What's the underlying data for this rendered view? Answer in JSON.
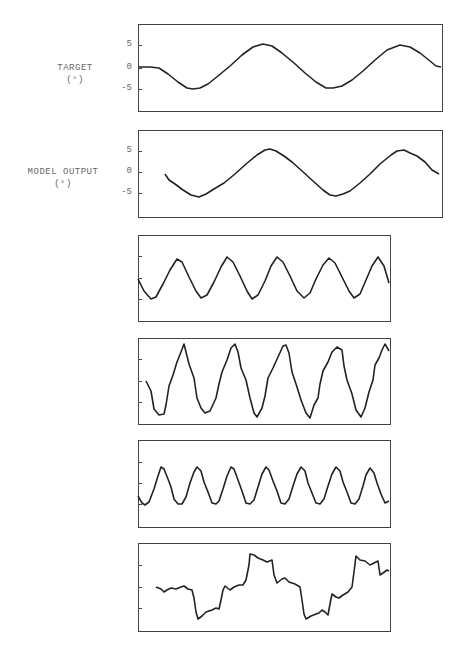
{
  "chart_data": [
    {
      "type": "line",
      "title": "",
      "ylabel": "TARGET (°)",
      "ylabel_lines": [
        "TARGET",
        "(°)"
      ],
      "yticks": [
        "5",
        "0",
        "-5"
      ],
      "ylim": [
        -9,
        9
      ],
      "grid": false,
      "frame_px": {
        "x": 138,
        "y": 24,
        "w": 304,
        "h": 87
      },
      "tick_px": [
        45,
        68,
        89
      ],
      "points_px": [
        [
          139,
          67
        ],
        [
          150,
          67
        ],
        [
          159,
          68
        ],
        [
          168,
          74
        ],
        [
          178,
          82
        ],
        [
          187,
          88
        ],
        [
          193,
          89
        ],
        [
          200,
          88
        ],
        [
          208,
          84
        ],
        [
          218,
          76
        ],
        [
          230,
          66
        ],
        [
          242,
          55
        ],
        [
          253,
          47
        ],
        [
          263,
          44
        ],
        [
          272,
          46
        ],
        [
          282,
          53
        ],
        [
          294,
          63
        ],
        [
          305,
          73
        ],
        [
          316,
          82
        ],
        [
          326,
          88
        ],
        [
          333,
          88
        ],
        [
          342,
          86
        ],
        [
          352,
          80
        ],
        [
          363,
          71
        ],
        [
          375,
          60
        ],
        [
          387,
          50
        ],
        [
          400,
          45
        ],
        [
          410,
          47
        ],
        [
          420,
          53
        ],
        [
          430,
          61
        ],
        [
          436,
          66
        ],
        [
          441,
          67
        ]
      ],
      "description": "Target angle: flat at 0°, then sinusoid ~±5° with two full cycles"
    },
    {
      "type": "line",
      "title": "",
      "ylabel": "MODEL OUTPUT (°)",
      "ylabel_lines": [
        "MODEL OUTPUT",
        "(°)"
      ],
      "yticks": [
        "5",
        "0",
        "-5"
      ],
      "ylim": [
        -9,
        9
      ],
      "grid": false,
      "frame_px": {
        "x": 138,
        "y": 130,
        "w": 304,
        "h": 87
      },
      "tick_px": [
        151,
        172,
        193
      ],
      "points_px": [
        [
          165,
          174
        ],
        [
          169,
          180
        ],
        [
          175,
          184
        ],
        [
          183,
          190
        ],
        [
          191,
          195
        ],
        [
          199,
          197
        ],
        [
          206,
          194
        ],
        [
          214,
          189
        ],
        [
          224,
          183
        ],
        [
          235,
          174
        ],
        [
          246,
          164
        ],
        [
          257,
          155
        ],
        [
          265,
          150
        ],
        [
          270,
          149
        ],
        [
          276,
          151
        ],
        [
          284,
          156
        ],
        [
          292,
          162
        ],
        [
          302,
          171
        ],
        [
          313,
          181
        ],
        [
          323,
          190
        ],
        [
          330,
          195
        ],
        [
          336,
          196
        ],
        [
          343,
          194
        ],
        [
          350,
          191
        ],
        [
          360,
          183
        ],
        [
          370,
          174
        ],
        [
          380,
          164
        ],
        [
          391,
          155
        ],
        [
          397,
          151
        ],
        [
          404,
          150
        ],
        [
          410,
          153
        ],
        [
          417,
          156
        ],
        [
          425,
          162
        ],
        [
          432,
          170
        ],
        [
          439,
          174
        ]
      ],
      "description": "Model output angle closely tracking target sinusoid ~±5°"
    },
    {
      "type": "line",
      "title": "",
      "ylabel": "",
      "yticks": [
        "",
        "",
        ""
      ],
      "grid": false,
      "frame_px": {
        "x": 138,
        "y": 235,
        "w": 252,
        "h": 86
      },
      "tick_px": [
        256,
        278,
        299
      ],
      "points_px": [
        [
          138,
          279
        ],
        [
          144,
          291
        ],
        [
          151,
          299
        ],
        [
          156,
          297
        ],
        [
          163,
          284
        ],
        [
          170,
          270
        ],
        [
          177,
          259
        ],
        [
          182,
          262
        ],
        [
          189,
          277
        ],
        [
          196,
          291
        ],
        [
          201,
          298
        ],
        [
          207,
          295
        ],
        [
          214,
          282
        ],
        [
          221,
          267
        ],
        [
          227,
          257
        ],
        [
          233,
          262
        ],
        [
          240,
          276
        ],
        [
          247,
          291
        ],
        [
          252,
          299
        ],
        [
          258,
          295
        ],
        [
          265,
          281
        ],
        [
          271,
          266
        ],
        [
          277,
          257
        ],
        [
          283,
          262
        ],
        [
          290,
          276
        ],
        [
          297,
          291
        ],
        [
          304,
          298
        ],
        [
          310,
          293
        ],
        [
          316,
          279
        ],
        [
          323,
          265
        ],
        [
          329,
          258
        ],
        [
          335,
          263
        ],
        [
          342,
          277
        ],
        [
          349,
          291
        ],
        [
          354,
          298
        ],
        [
          360,
          294
        ],
        [
          366,
          280
        ],
        [
          372,
          266
        ],
        [
          378,
          257
        ],
        [
          384,
          266
        ],
        [
          389,
          283
        ]
      ],
      "description": "Unit trace 1: smooth sinusoid, ~5 cycles"
    },
    {
      "type": "line",
      "title": "",
      "ylabel": "",
      "yticks": [
        "",
        "",
        ""
      ],
      "grid": false,
      "frame_px": {
        "x": 138,
        "y": 338,
        "w": 252,
        "h": 86
      },
      "tick_px": [
        359,
        381,
        402
      ],
      "points_px": [
        [
          146,
          381
        ],
        [
          151,
          391
        ],
        [
          154,
          409
        ],
        [
          159,
          415
        ],
        [
          164,
          414
        ],
        [
          166,
          405
        ],
        [
          169,
          386
        ],
        [
          173,
          375
        ],
        [
          177,
          362
        ],
        [
          181,
          352
        ],
        [
          184,
          344
        ],
        [
          186,
          352
        ],
        [
          189,
          364
        ],
        [
          194,
          378
        ],
        [
          197,
          398
        ],
        [
          201,
          408
        ],
        [
          205,
          413
        ],
        [
          210,
          411
        ],
        [
          216,
          398
        ],
        [
          219,
          384
        ],
        [
          222,
          372
        ],
        [
          227,
          360
        ],
        [
          231,
          348
        ],
        [
          235,
          344
        ],
        [
          238,
          352
        ],
        [
          241,
          368
        ],
        [
          246,
          380
        ],
        [
          250,
          398
        ],
        [
          254,
          413
        ],
        [
          257,
          417
        ],
        [
          262,
          408
        ],
        [
          265,
          396
        ],
        [
          268,
          378
        ],
        [
          273,
          368
        ],
        [
          278,
          357
        ],
        [
          283,
          346
        ],
        [
          286,
          345
        ],
        [
          289,
          353
        ],
        [
          292,
          372
        ],
        [
          297,
          387
        ],
        [
          301,
          400
        ],
        [
          306,
          413
        ],
        [
          310,
          418
        ],
        [
          314,
          405
        ],
        [
          318,
          398
        ],
        [
          320,
          384
        ],
        [
          323,
          371
        ],
        [
          328,
          362
        ],
        [
          332,
          352
        ],
        [
          337,
          347
        ],
        [
          342,
          350
        ],
        [
          344,
          366
        ],
        [
          347,
          380
        ],
        [
          352,
          394
        ],
        [
          356,
          410
        ],
        [
          361,
          417
        ],
        [
          365,
          408
        ],
        [
          369,
          392
        ],
        [
          373,
          380
        ],
        [
          375,
          365
        ],
        [
          379,
          358
        ],
        [
          382,
          350
        ],
        [
          385,
          344
        ],
        [
          389,
          351
        ]
      ],
      "description": "Unit trace 2: skewed periodic waveform with sharp peaks, ~5 cycles"
    },
    {
      "type": "line",
      "title": "",
      "ylabel": "",
      "yticks": [
        "",
        "",
        ""
      ],
      "grid": false,
      "frame_px": {
        "x": 138,
        "y": 440,
        "w": 252,
        "h": 87
      },
      "tick_px": [
        462,
        483,
        504
      ],
      "points_px": [
        [
          138,
          496
        ],
        [
          142,
          503
        ],
        [
          145,
          505
        ],
        [
          149,
          502
        ],
        [
          154,
          489
        ],
        [
          158,
          476
        ],
        [
          161,
          467
        ],
        [
          164,
          469
        ],
        [
          168,
          479
        ],
        [
          171,
          487
        ],
        [
          174,
          499
        ],
        [
          178,
          504
        ],
        [
          182,
          504
        ],
        [
          186,
          497
        ],
        [
          190,
          483
        ],
        [
          194,
          472
        ],
        [
          197,
          467
        ],
        [
          201,
          471
        ],
        [
          204,
          482
        ],
        [
          208,
          492
        ],
        [
          212,
          503
        ],
        [
          216,
          504
        ],
        [
          219,
          501
        ],
        [
          223,
          489
        ],
        [
          227,
          476
        ],
        [
          231,
          467
        ],
        [
          234,
          469
        ],
        [
          238,
          480
        ],
        [
          242,
          491
        ],
        [
          246,
          503
        ],
        [
          250,
          504
        ],
        [
          254,
          500
        ],
        [
          258,
          487
        ],
        [
          262,
          474
        ],
        [
          266,
          467
        ],
        [
          269,
          470
        ],
        [
          273,
          481
        ],
        [
          277,
          491
        ],
        [
          281,
          503
        ],
        [
          285,
          504
        ],
        [
          289,
          499
        ],
        [
          293,
          486
        ],
        [
          297,
          474
        ],
        [
          301,
          467
        ],
        [
          305,
          471
        ],
        [
          308,
          483
        ],
        [
          312,
          493
        ],
        [
          316,
          503
        ],
        [
          320,
          504
        ],
        [
          324,
          499
        ],
        [
          328,
          486
        ],
        [
          332,
          474
        ],
        [
          336,
          467
        ],
        [
          340,
          471
        ],
        [
          343,
          482
        ],
        [
          347,
          492
        ],
        [
          351,
          503
        ],
        [
          355,
          504
        ],
        [
          359,
          499
        ],
        [
          363,
          486
        ],
        [
          366,
          475
        ],
        [
          370,
          468
        ],
        [
          374,
          473
        ],
        [
          377,
          483
        ],
        [
          381,
          494
        ],
        [
          385,
          503
        ],
        [
          389,
          501
        ]
      ],
      "description": "Unit trace 3: higher-frequency sinusoid, ~7 cycles"
    },
    {
      "type": "line",
      "title": "",
      "ylabel": "",
      "yticks": [
        "",
        "",
        ""
      ],
      "grid": false,
      "frame_px": {
        "x": 138,
        "y": 543,
        "w": 252,
        "h": 88
      },
      "tick_px": [
        565,
        587,
        608
      ],
      "points_px": [
        [
          156,
          587
        ],
        [
          161,
          589
        ],
        [
          164,
          592
        ],
        [
          167,
          590
        ],
        [
          171,
          588
        ],
        [
          176,
          589
        ],
        [
          181,
          587
        ],
        [
          184,
          586
        ],
        [
          188,
          589
        ],
        [
          192,
          590
        ],
        [
          194,
          598
        ],
        [
          196,
          612
        ],
        [
          198,
          619
        ],
        [
          202,
          616
        ],
        [
          206,
          612
        ],
        [
          212,
          610
        ],
        [
          216,
          608
        ],
        [
          219,
          609
        ],
        [
          221,
          600
        ],
        [
          223,
          590
        ],
        [
          225,
          586
        ],
        [
          230,
          590
        ],
        [
          234,
          587
        ],
        [
          239,
          585
        ],
        [
          243,
          585
        ],
        [
          246,
          580
        ],
        [
          249,
          565
        ],
        [
          250,
          554
        ],
        [
          254,
          555
        ],
        [
          258,
          558
        ],
        [
          263,
          560
        ],
        [
          267,
          562
        ],
        [
          272,
          560
        ],
        [
          274,
          575
        ],
        [
          277,
          583
        ],
        [
          282,
          579
        ],
        [
          285,
          578
        ],
        [
          289,
          582
        ],
        [
          295,
          584
        ],
        [
          300,
          587
        ],
        [
          302,
          600
        ],
        [
          304,
          614
        ],
        [
          306,
          619
        ],
        [
          311,
          616
        ],
        [
          316,
          614
        ],
        [
          319,
          613
        ],
        [
          322,
          610
        ],
        [
          325,
          612
        ],
        [
          328,
          615
        ],
        [
          330,
          604
        ],
        [
          332,
          594
        ],
        [
          336,
          597
        ],
        [
          339,
          598
        ],
        [
          343,
          595
        ],
        [
          348,
          592
        ],
        [
          352,
          587
        ],
        [
          354,
          572
        ],
        [
          356,
          556
        ],
        [
          360,
          560
        ],
        [
          365,
          561
        ],
        [
          370,
          565
        ],
        [
          374,
          563
        ],
        [
          378,
          561
        ],
        [
          380,
          575
        ],
        [
          383,
          573
        ],
        [
          387,
          570
        ],
        [
          389,
          571
        ]
      ],
      "description": "Unit trace 4: step-like staircase waveform with small ripples"
    }
  ]
}
